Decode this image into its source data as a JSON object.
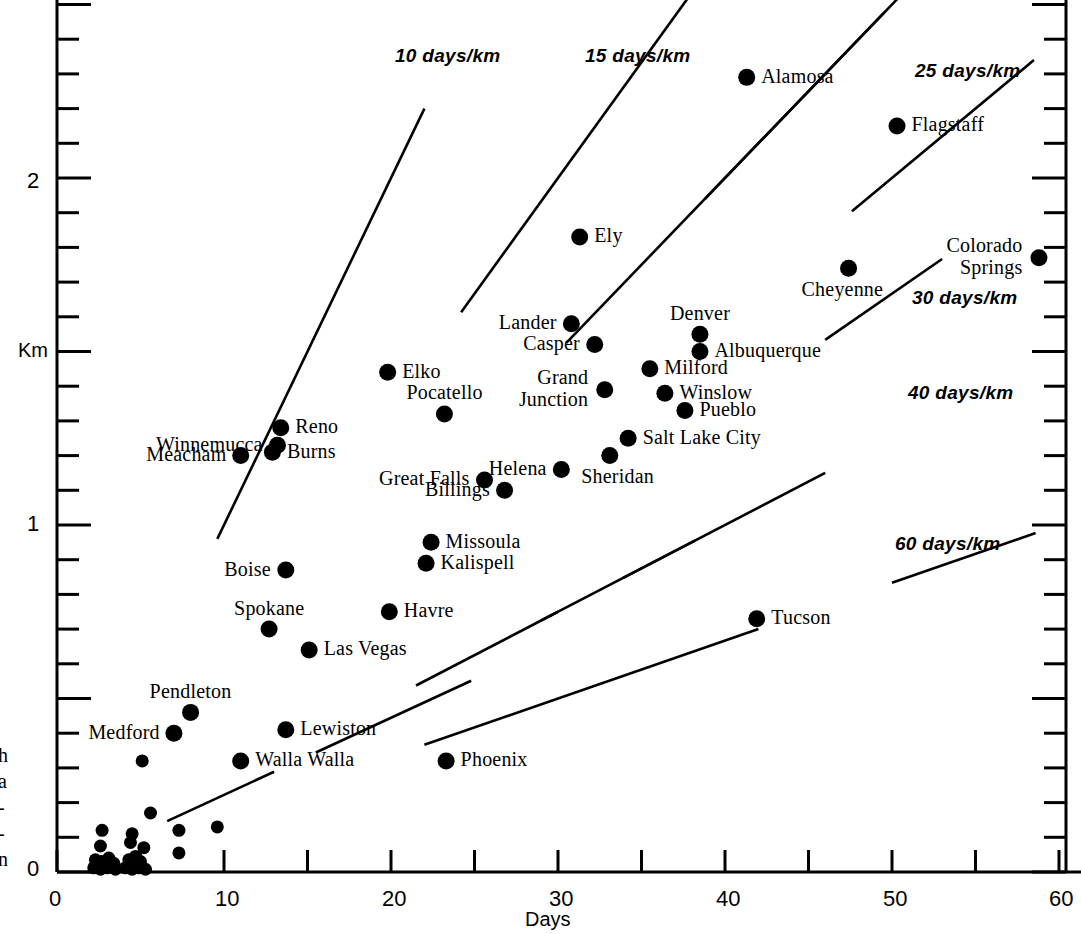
{
  "chart_data": {
    "type": "scatter",
    "title": "",
    "xlabel": "Days",
    "ylabel": "Km",
    "xlim": [
      0,
      60
    ],
    "ylim": [
      0,
      2.55
    ],
    "xticks": [
      0,
      10,
      20,
      30,
      40,
      50,
      60
    ],
    "xtick_labels": [
      "0",
      "10",
      "20",
      "30",
      "40",
      "50",
      "60"
    ],
    "xminor_step": 5,
    "yticks": [
      0,
      1,
      2
    ],
    "ytick_labels": [
      "0",
      "1",
      "2"
    ],
    "yminor_step": 0.1,
    "ymajor_step": 0.5,
    "grid": false,
    "legend": "none",
    "points": [
      {
        "name": "Alamosa",
        "x": 41.3,
        "y": 2.29,
        "label_pos": "right"
      },
      {
        "name": "Flagstaff",
        "x": 50.3,
        "y": 2.15,
        "label_pos": "right"
      },
      {
        "name": "Ely",
        "x": 31.3,
        "y": 1.83,
        "label_pos": "right"
      },
      {
        "name": "Cheyenne",
        "x": 47.4,
        "y": 1.74,
        "label_pos": "below-left"
      },
      {
        "name": "Colorado Springs",
        "x": 58.8,
        "y": 1.77,
        "label_pos": "left-two-line"
      },
      {
        "name": "Lander",
        "x": 30.8,
        "y": 1.58,
        "label_pos": "left"
      },
      {
        "name": "Denver",
        "x": 38.5,
        "y": 1.55,
        "label_pos": "above"
      },
      {
        "name": "Albuquerque",
        "x": 38.5,
        "y": 1.5,
        "label_pos": "right"
      },
      {
        "name": "Casper",
        "x": 32.2,
        "y": 1.52,
        "label_pos": "left"
      },
      {
        "name": "Milford",
        "x": 35.5,
        "y": 1.45,
        "label_pos": "right"
      },
      {
        "name": "Elko",
        "x": 19.8,
        "y": 1.44,
        "label_pos": "right"
      },
      {
        "name": "Grand Junction",
        "x": 32.8,
        "y": 1.39,
        "label_pos": "left-two-line"
      },
      {
        "name": "Winslow",
        "x": 36.4,
        "y": 1.38,
        "label_pos": "right"
      },
      {
        "name": "Pueblo",
        "x": 37.6,
        "y": 1.33,
        "label_pos": "right"
      },
      {
        "name": "Pocatello",
        "x": 23.2,
        "y": 1.32,
        "label_pos": "above"
      },
      {
        "name": "Reno",
        "x": 13.4,
        "y": 1.28,
        "label_pos": "right"
      },
      {
        "name": "Winnemucca",
        "x": 13.2,
        "y": 1.23,
        "label_pos": "left"
      },
      {
        "name": "Salt Lake City",
        "x": 34.2,
        "y": 1.25,
        "label_pos": "right"
      },
      {
        "name": "Burns",
        "x": 12.9,
        "y": 1.21,
        "label_pos": "right"
      },
      {
        "name": "Meacham",
        "x": 11.0,
        "y": 1.2,
        "label_pos": "left"
      },
      {
        "name": "Sheridan",
        "x": 33.1,
        "y": 1.2,
        "label_pos": "below"
      },
      {
        "name": "Helena",
        "x": 30.2,
        "y": 1.16,
        "label_pos": "left"
      },
      {
        "name": "Great Falls",
        "x": 25.6,
        "y": 1.13,
        "label_pos": "left"
      },
      {
        "name": "Billings",
        "x": 26.8,
        "y": 1.1,
        "label_pos": "left"
      },
      {
        "name": "Missoula",
        "x": 22.4,
        "y": 0.95,
        "label_pos": "right"
      },
      {
        "name": "Kalispell",
        "x": 22.1,
        "y": 0.89,
        "label_pos": "right"
      },
      {
        "name": "Boise",
        "x": 13.7,
        "y": 0.87,
        "label_pos": "left"
      },
      {
        "name": "Havre",
        "x": 19.9,
        "y": 0.75,
        "label_pos": "right"
      },
      {
        "name": "Tucson",
        "x": 41.9,
        "y": 0.73,
        "label_pos": "right"
      },
      {
        "name": "Spokane",
        "x": 12.7,
        "y": 0.7,
        "label_pos": "above"
      },
      {
        "name": "Las Vegas",
        "x": 15.1,
        "y": 0.64,
        "label_pos": "right"
      },
      {
        "name": "Pendleton",
        "x": 8.0,
        "y": 0.46,
        "label_pos": "above"
      },
      {
        "name": "Lewiston",
        "x": 13.7,
        "y": 0.41,
        "label_pos": "right"
      },
      {
        "name": "Medford",
        "x": 7.0,
        "y": 0.4,
        "label_pos": "left"
      },
      {
        "name": "Walla Walla",
        "x": 11.0,
        "y": 0.32,
        "label_pos": "right"
      },
      {
        "name": "Phoenix",
        "x": 23.3,
        "y": 0.32,
        "label_pos": "right"
      },
      {
        "name": "",
        "x": 5.1,
        "y": 0.32,
        "label_pos": "none"
      },
      {
        "name": "",
        "x": 5.6,
        "y": 0.17,
        "label_pos": "none"
      },
      {
        "name": "",
        "x": 9.6,
        "y": 0.13,
        "label_pos": "none"
      },
      {
        "name": "",
        "x": 2.7,
        "y": 0.12,
        "label_pos": "none"
      },
      {
        "name": "",
        "x": 4.5,
        "y": 0.11,
        "label_pos": "none"
      },
      {
        "name": "",
        "x": 7.3,
        "y": 0.12,
        "label_pos": "none"
      },
      {
        "name": "",
        "x": 2.6,
        "y": 0.075,
        "label_pos": "none"
      },
      {
        "name": "",
        "x": 4.4,
        "y": 0.085,
        "label_pos": "none"
      },
      {
        "name": "",
        "x": 5.2,
        "y": 0.07,
        "label_pos": "none"
      },
      {
        "name": "",
        "x": 7.3,
        "y": 0.055,
        "label_pos": "none"
      },
      {
        "name": "",
        "x": 2.3,
        "y": 0.035,
        "label_pos": "none"
      },
      {
        "name": "",
        "x": 2.7,
        "y": 0.03,
        "label_pos": "none"
      },
      {
        "name": "",
        "x": 3.1,
        "y": 0.04,
        "label_pos": "none"
      },
      {
        "name": "",
        "x": 3.4,
        "y": 0.025,
        "label_pos": "none"
      },
      {
        "name": "",
        "x": 4.3,
        "y": 0.035,
        "label_pos": "none"
      },
      {
        "name": "",
        "x": 4.7,
        "y": 0.045,
        "label_pos": "none"
      },
      {
        "name": "",
        "x": 5.0,
        "y": 0.03,
        "label_pos": "none"
      },
      {
        "name": "",
        "x": 2.2,
        "y": 0.012,
        "label_pos": "none"
      },
      {
        "name": "",
        "x": 2.6,
        "y": 0.008,
        "label_pos": "none"
      },
      {
        "name": "",
        "x": 3.0,
        "y": 0.012,
        "label_pos": "none"
      },
      {
        "name": "",
        "x": 3.5,
        "y": 0.008,
        "label_pos": "none"
      },
      {
        "name": "",
        "x": 4.1,
        "y": 0.012,
        "label_pos": "none"
      },
      {
        "name": "",
        "x": 4.5,
        "y": 0.008,
        "label_pos": "none"
      },
      {
        "name": "",
        "x": 4.9,
        "y": 0.012,
        "label_pos": "none"
      },
      {
        "name": "",
        "x": 5.3,
        "y": 0.008,
        "label_pos": "none"
      }
    ],
    "rate_lines": [
      {
        "label": "10 days/km",
        "rate": 10,
        "x_start": 9.6,
        "x_end": 22.0,
        "label_x": 395,
        "label_y": 45
      },
      {
        "label": "15 days/km",
        "rate": 15,
        "x_start": 24.2,
        "x_end": 38.5,
        "label_x": 585,
        "label_y": 45
      },
      {
        "label": "",
        "rate": 20,
        "x_start": 30.5,
        "x_end": 49.5,
        "label_x": 0,
        "label_y": 0
      },
      {
        "label": "",
        "rate": 20,
        "x_start": 38.8,
        "x_end": 51.0,
        "label_x": 0,
        "label_y": 0
      },
      {
        "label": "25 days/km",
        "rate": 25,
        "x_start": 47.6,
        "x_end": 58.5,
        "label_x": 915,
        "label_y": 60
      },
      {
        "label": "30 days/km",
        "rate": 30,
        "x_start": 46.0,
        "x_end": 53.0,
        "label_x": 912,
        "label_y": 287
      },
      {
        "label": "40 days/km",
        "rate": 40,
        "x_start": 33.9,
        "x_end": 46.0,
        "label_x": 908,
        "label_y": 382
      },
      {
        "label": "",
        "rate": 40,
        "x_start": 29.0,
        "x_end": 38.2,
        "label_x": 0,
        "label_y": 0
      },
      {
        "label": "",
        "rate": 40,
        "x_start": 21.5,
        "x_end": 30.0,
        "label_x": 0,
        "label_y": 0
      },
      {
        "label": "",
        "rate": 45,
        "x_start": 15.5,
        "x_end": 24.8,
        "label_x": 0,
        "label_y": 0
      },
      {
        "label": "",
        "rate": 45,
        "x_start": 6.6,
        "x_end": 13.0,
        "label_x": 0,
        "label_y": 0
      },
      {
        "label": "60 days/km",
        "rate": 60,
        "x_start": 50.0,
        "x_end": 58.6,
        "label_x": 895,
        "label_y": 533
      },
      {
        "label": "",
        "rate": 60,
        "x_start": 22.0,
        "x_end": 42.0,
        "label_x": 0,
        "label_y": 0
      }
    ]
  },
  "axes": {
    "y_label": "Km",
    "x_label": "Days",
    "y_tick_0": "0",
    "y_tick_1": "1",
    "y_tick_2": "2",
    "x_tick_0": "0",
    "x_tick_10": "10",
    "x_tick_20": "20",
    "x_tick_30": "30",
    "x_tick_40": "40",
    "x_tick_50": "50",
    "x_tick_60": "60"
  },
  "margin_text": {
    "clipped_lines": "h\na\n-\n-\nn"
  },
  "colors": {
    "ink": "#000000",
    "paper": "#ffffff"
  }
}
